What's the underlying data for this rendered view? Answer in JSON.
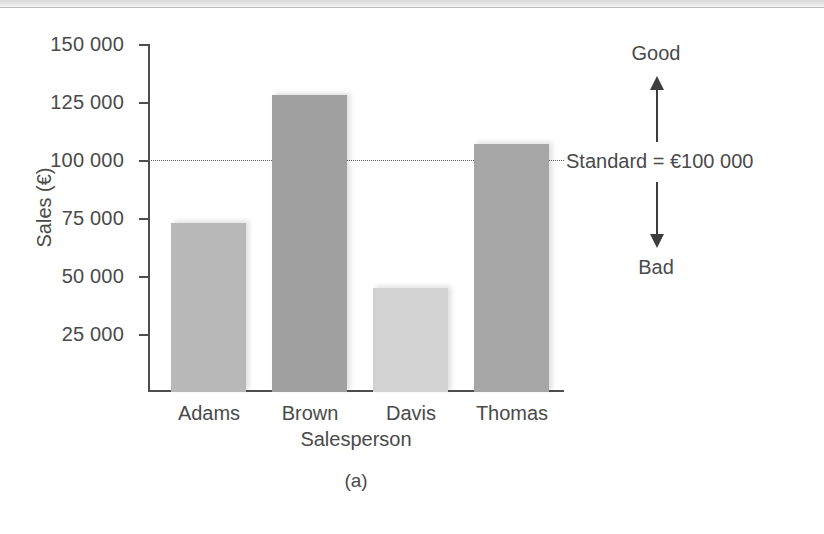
{
  "caption": "(a)",
  "annotation": {
    "good_label": "Good",
    "bad_label": "Bad",
    "standard_label": "Standard = €100 000",
    "up_arrow_icon": "arrow-up-icon",
    "down_arrow_icon": "arrow-down-icon"
  },
  "chart_data": {
    "type": "bar",
    "title": "",
    "subtitle": "",
    "xlabel": "Salesperson",
    "ylabel": "Sales (€)",
    "categories": [
      "Adams",
      "Brown",
      "Davis",
      "Thomas"
    ],
    "values": [
      73000,
      128000,
      45000,
      107000
    ],
    "bar_colors": [
      "#b8b8b8",
      "#a0a0a0",
      "#d2d2d2",
      "#a6a6a6"
    ],
    "ylim": [
      0,
      150000
    ],
    "yticks": [
      25000,
      50000,
      75000,
      100000,
      125000,
      150000
    ],
    "ytick_labels": [
      "25 000",
      "50 000",
      "75 000",
      "100 000",
      "125 000",
      "150 000"
    ],
    "grid": false,
    "legend": "none",
    "reference_line": {
      "value": 100000,
      "label": "Standard = €100 000",
      "style": "dotted",
      "color": "#5a5a5a"
    }
  }
}
